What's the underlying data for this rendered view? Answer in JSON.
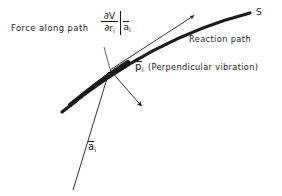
{
  "figure": {
    "type": "vector-diagram",
    "background_color": "#ffffff",
    "ink_color": "#1a1a1a"
  },
  "labels": {
    "force_along_path": "Force along path",
    "force_expression": {
      "numerator": "∂V",
      "denominator_partial": "∂",
      "denominator_symbol": "r",
      "denominator_sub": "i",
      "evaluated_at_symbol": "a",
      "evaluated_at_sub": "i"
    },
    "curve_terminus": "S",
    "reaction_path": "Reaction path",
    "perpendicular_symbol": "p",
    "perpendicular_symbol_sub": "i",
    "perpendicular_text": "(Perpendicular vibration)",
    "a_vector_symbol": "a",
    "a_vector_sub": "i"
  },
  "geometry": {
    "intersection_point": [
      110,
      70
    ],
    "reaction_curve": {
      "name": "reaction-path-curve",
      "start": [
        62,
        112
      ],
      "control_1": [
        96,
        84
      ],
      "control_2": [
        160,
        36
      ],
      "end": [
        250,
        13
      ],
      "stroke_width": 3.2
    },
    "tangent_force_arrow": {
      "name": "force-along-path-arrow",
      "start": [
        110,
        70
      ],
      "end": [
        196,
        14
      ],
      "stroke_width": 0.9
    },
    "a_vector_arrow": {
      "name": "a-vector-arrow",
      "start": [
        73,
        190
      ],
      "end": [
        110,
        70
      ],
      "stroke_width": 0.9
    },
    "perpendicular_arrow": {
      "name": "perpendicular-vibration-arrow",
      "start": [
        110,
        70
      ],
      "end": [
        143,
        108
      ],
      "stroke_width": 0.9
    },
    "leader_line": {
      "name": "force-label-leader-line",
      "start": [
        104,
        47
      ],
      "end": [
        110,
        70
      ],
      "stroke_width": 0.7
    }
  }
}
